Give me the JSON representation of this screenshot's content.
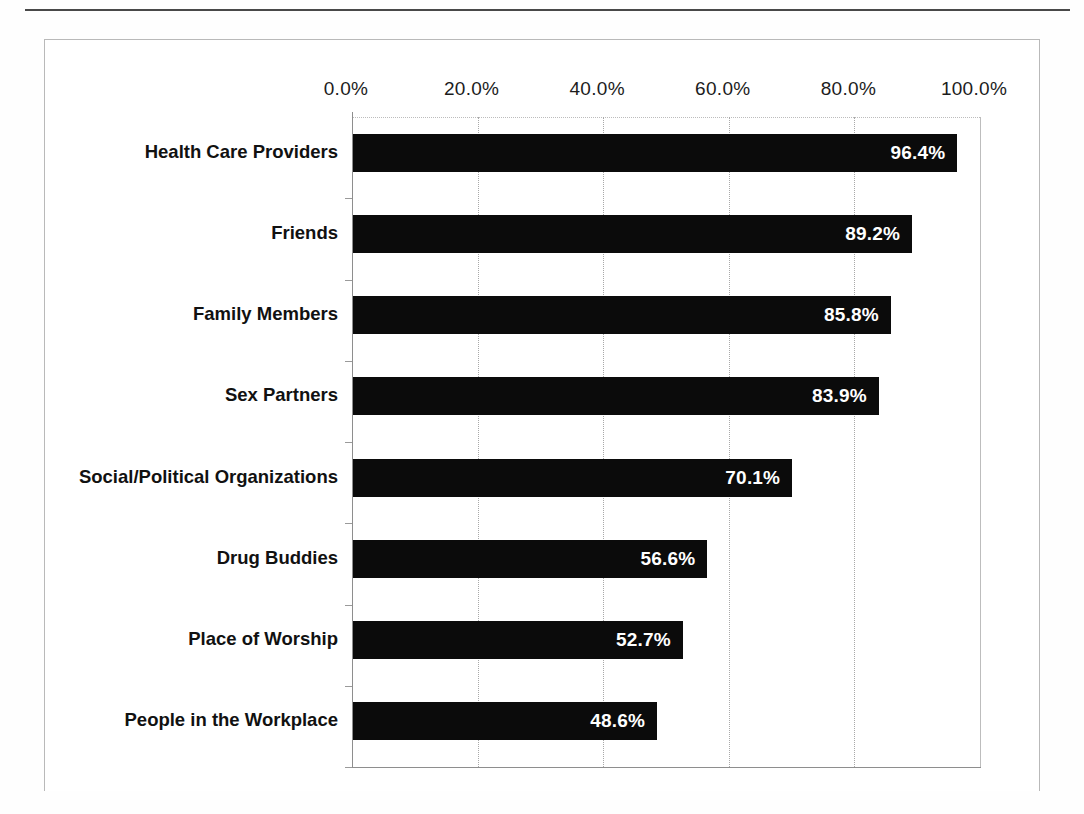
{
  "chart_data": {
    "type": "bar",
    "orientation": "horizontal",
    "title": "",
    "subtitle": "",
    "xlabel": "",
    "ylabel": "",
    "xlim": [
      0,
      100
    ],
    "grid": true,
    "legend": "none",
    "tick_labels": [
      "0.0%",
      "20.0%",
      "40.0%",
      "60.0%",
      "80.0%",
      "100.0%"
    ],
    "ticks": [
      0,
      20,
      40,
      60,
      80,
      100
    ],
    "categories": [
      "Health Care Providers",
      "Friends",
      "Family Members",
      "Sex Partners",
      "Social/Political Organizations",
      "Drug Buddies",
      "Place of Worship",
      "People in the Workplace"
    ],
    "values": [
      96.4,
      89.2,
      85.8,
      83.9,
      70.1,
      56.6,
      52.7,
      48.6
    ],
    "value_labels": [
      "96.4%",
      "89.2%",
      "85.8%",
      "83.9%",
      "70.1%",
      "56.6%",
      "52.7%",
      "48.6%"
    ],
    "bar_color": "#0b0b0b",
    "value_label_color": "#ffffff",
    "grid_color": "#a8a8a8",
    "axis_color": "#8e8e8e"
  }
}
